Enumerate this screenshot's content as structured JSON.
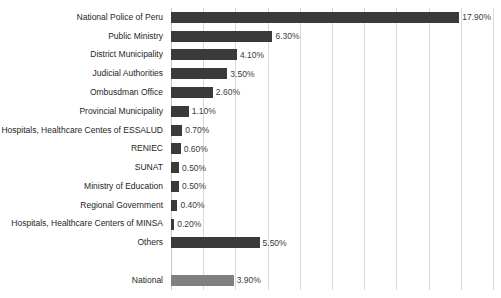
{
  "chart_data": {
    "type": "bar",
    "orientation": "horizontal",
    "title": "",
    "subtitle": "",
    "xlabel": "",
    "ylabel": "",
    "xlim": [
      0,
      20
    ],
    "grid": true,
    "gridline_interval": 2,
    "gridline_count": 11,
    "legend": "none",
    "value_label_suffix": "%",
    "categories": [
      "National Police of Peru",
      "Public Ministry",
      "District Municipality",
      "Judicial Authorities",
      "Ombusdman Office",
      "Provincial Municipality",
      "Hospitals, Healthcare Centes of ESSALUD",
      "RENIEC",
      "SUNAT",
      "Ministry of Education",
      "Regional Government",
      "Hospitals, Healthcare Centers of MINSA",
      "Others",
      "",
      "National"
    ],
    "values": [
      17.9,
      6.3,
      4.1,
      3.5,
      2.6,
      1.1,
      0.7,
      0.6,
      0.5,
      0.5,
      0.4,
      0.2,
      5.5,
      null,
      3.9
    ],
    "value_labels": [
      "17.90%",
      "6.30%",
      "4.10%",
      "3.50%",
      "2.60%",
      "1.10%",
      "0.70%",
      "0.60%",
      "0.50%",
      "0.50%",
      "0.40%",
      "0.20%",
      "5.50%",
      "",
      "3.90%"
    ],
    "bar_colors": [
      "#3a3a3a",
      "#3a3a3a",
      "#3a3a3a",
      "#3a3a3a",
      "#3a3a3a",
      "#3a3a3a",
      "#3a3a3a",
      "#3a3a3a",
      "#3a3a3a",
      "#3a3a3a",
      "#3a3a3a",
      "#3a3a3a",
      "#3a3a3a",
      "none",
      "#808080"
    ],
    "colors": {
      "bar_primary": "#3a3a3a",
      "bar_accent": "#808080",
      "gridline": "#d9d9d9",
      "axis": "#c9c9c9",
      "label_text": "#262626",
      "value_text": "#3b3b3b",
      "background": "#ffffff"
    }
  }
}
